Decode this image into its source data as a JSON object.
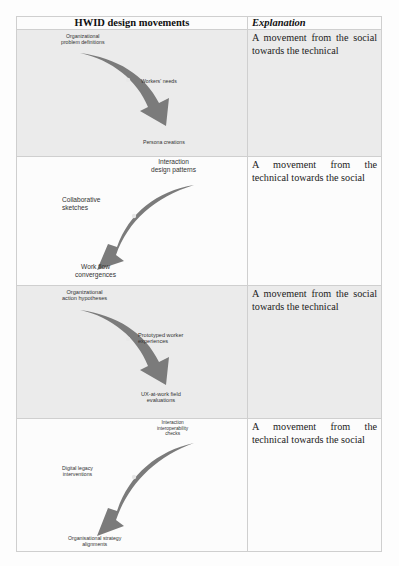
{
  "table": {
    "headers": {
      "left": "HWID design movements",
      "right": "Explanation"
    },
    "rows": [
      {
        "direction": "social-to-technical",
        "labels": {
          "start": "Organizational problem definitions",
          "start_l1": "Organizational",
          "start_l2": "problem definitions",
          "middle": "Workers' needs",
          "end": "Persona creations"
        },
        "explanation": "A movement from the social towards the technical"
      },
      {
        "direction": "technical-to-social",
        "labels": {
          "start_l1": "Interaction",
          "start_l2": "design patterns",
          "middle_l1": "Collaborative",
          "middle_l2": "sketches",
          "end_l1": "Work flow",
          "end_l2": "convergences"
        },
        "explanation": "A movement from the technical towards the social"
      },
      {
        "direction": "social-to-technical",
        "labels": {
          "start_l1": "Organizational",
          "start_l2": "action hypotheses",
          "middle_l1": "Prototyped worker",
          "middle_l2": "experiences",
          "end_l1": "UX-at-work field",
          "end_l2": "evaluations"
        },
        "explanation": "A movement from the social towards the technical"
      },
      {
        "direction": "technical-to-social",
        "labels": {
          "start_l1": "Interaction",
          "start_l2": "interoperability",
          "start_l3": "checks",
          "middle_l1": "Digital legacy",
          "middle_l2": "interventions",
          "end_l1": "Organisational strategy",
          "end_l2": "alignments"
        },
        "explanation": "A movement from the technical towards the social"
      }
    ]
  },
  "colors": {
    "arrow": "#7b7b7b",
    "shaded_row": "#ebebeb",
    "border": "#cfcfcf"
  }
}
